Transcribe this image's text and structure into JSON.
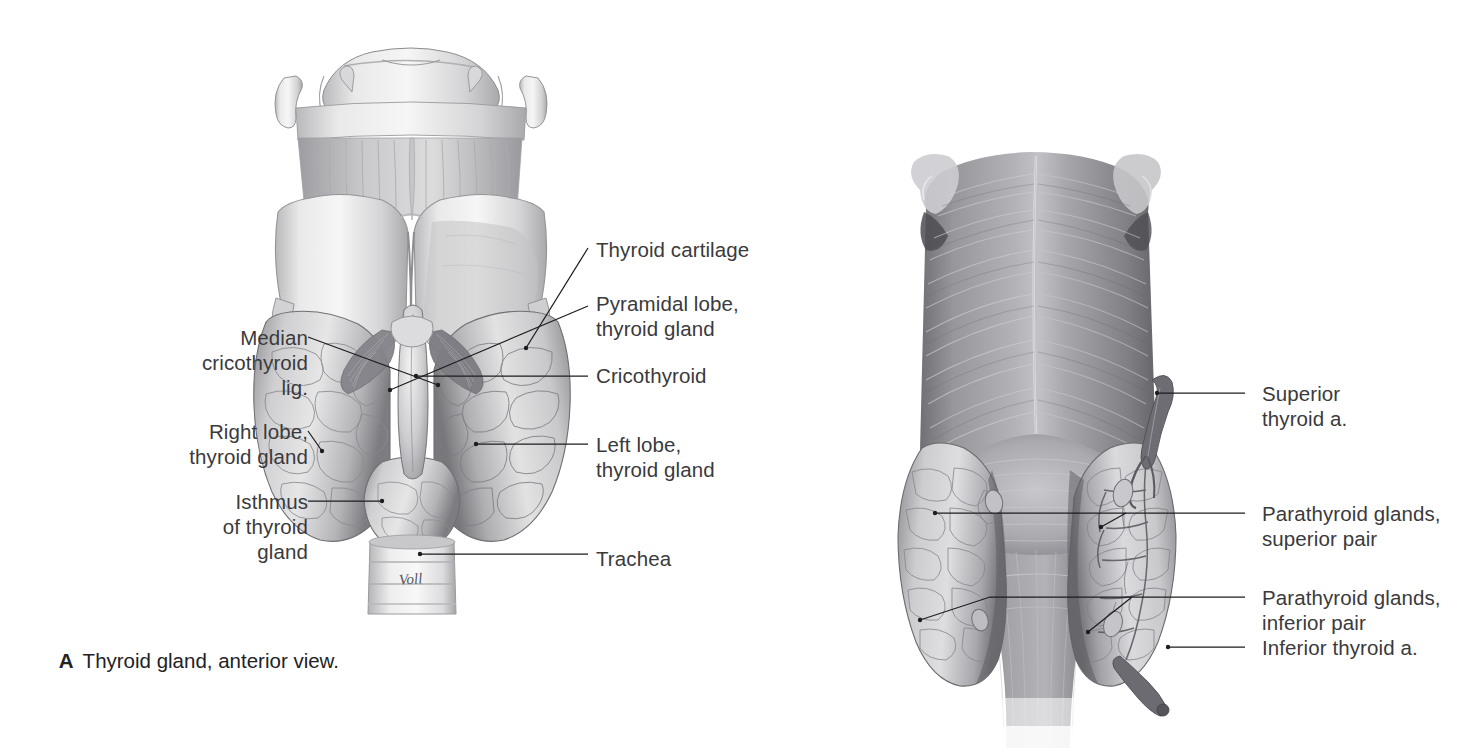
{
  "figure_a": {
    "id": "A",
    "caption_letter": "A",
    "caption_text": "Thyroid gland, anterior view.",
    "artist_signature": "Voll",
    "labels_left": [
      {
        "id": "median-cricothyroid-lig",
        "text": "Median\ncricothyroid\nlig."
      },
      {
        "id": "right-lobe-thyroid-gland",
        "text": "Right lobe,\nthyroid gland"
      },
      {
        "id": "isthmus-of-thyroid-gland",
        "text": "Isthmus\nof thyroid\ngland"
      }
    ],
    "labels_right": [
      {
        "id": "thyroid-cartilage",
        "text": "Thyroid cartilage"
      },
      {
        "id": "pyramidal-lobe-thyroid-gland",
        "text": "Pyramidal lobe,\nthyroid gland"
      },
      {
        "id": "cricothyroid",
        "text": "Cricothyroid"
      },
      {
        "id": "left-lobe-thyroid-gland",
        "text": "Left lobe,\nthyroid gland"
      },
      {
        "id": "trachea",
        "text": "Trachea"
      }
    ]
  },
  "figure_b": {
    "id": "B",
    "labels_right": [
      {
        "id": "superior-thyroid-artery",
        "text": "Superior\nthyroid a."
      },
      {
        "id": "parathyroid-glands-superior-pair",
        "text": "Parathyroid glands,\nsuperior pair"
      },
      {
        "id": "parathyroid-glands-inferior-pair",
        "text": "Parathyroid glands,\ninferior pair"
      },
      {
        "id": "inferior-thyroid-artery",
        "text": "Inferior thyroid a."
      }
    ]
  },
  "colors": {
    "background": "#ffffff",
    "label_text": "#3a3a3c",
    "caption_text": "#222226",
    "leader_line": "#1d1d1f",
    "illustration_mid": "#9a9a9d",
    "illustration_light": "#e2e2e2",
    "illustration_dark": "#5e5e62"
  }
}
